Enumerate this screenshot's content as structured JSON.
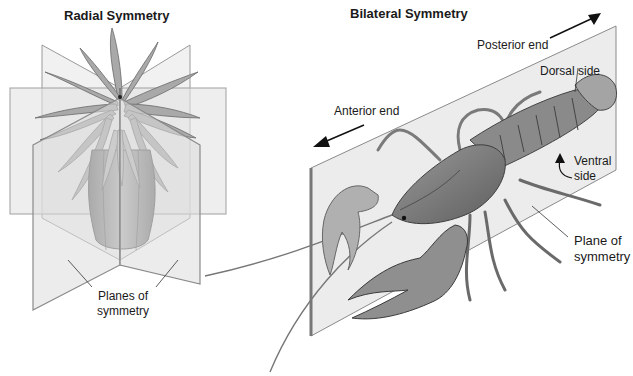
{
  "radial": {
    "title": "Radial Symmetry",
    "planes_label_line1": "Planes of",
    "planes_label_line2": "symmetry"
  },
  "bilateral": {
    "title": "Bilateral Symmetry",
    "posterior_label": "Posterior end",
    "anterior_label": "Anterior end",
    "dorsal_label": "Dorsal side",
    "ventral_label_line1": "Ventral",
    "ventral_label_line2": "side",
    "plane_label_line1": "Plane of",
    "plane_label_line2": "symmetry"
  },
  "colors": {
    "plane_fill": "#e6e6e6",
    "plane_edge": "#8a8a8a",
    "organism": "#8c8c8c",
    "text": "#1a1a1a"
  }
}
